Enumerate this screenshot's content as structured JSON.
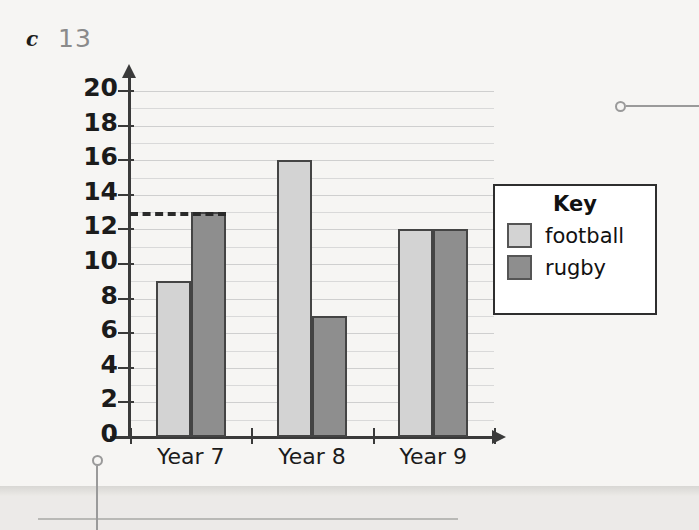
{
  "question": {
    "part_label": "c",
    "answer": "13"
  },
  "chart_data": {
    "type": "bar",
    "title": "",
    "xlabel": "",
    "ylabel": "",
    "categories": [
      "Year 7",
      "Year 8",
      "Year 9"
    ],
    "series": [
      {
        "name": "football",
        "color": "#d3d3d3",
        "values": [
          9,
          16,
          12
        ]
      },
      {
        "name": "rugby",
        "color": "#8e8e8e",
        "values": [
          13,
          7,
          12
        ]
      }
    ],
    "ylim": [
      0,
      20
    ],
    "ytick_step": 2,
    "ytick_labels": [
      "0",
      "2",
      "4",
      "6",
      "8",
      "10",
      "12",
      "14",
      "16",
      "18",
      "20"
    ],
    "gridline_step": 1,
    "grid": true,
    "legend_position": "right",
    "legend_title": "Key",
    "annotations": [
      {
        "type": "dashed-line",
        "orientation": "horizontal",
        "value": 13,
        "label": "13"
      }
    ]
  },
  "legend": {
    "title": "Key",
    "entries": [
      {
        "label": "football",
        "color": "#d3d3d3"
      },
      {
        "label": "rugby",
        "color": "#8e8e8e"
      }
    ]
  },
  "callouts": [
    {
      "name": "bottom-left-callout",
      "x": 97,
      "y": 460
    },
    {
      "name": "right-callout",
      "x": 620,
      "y": 106
    }
  ],
  "colors": {
    "football": "#d3d3d3",
    "rugby": "#8e8e8e",
    "axis": "#3a3a3a",
    "grid": "#d9d9d9",
    "answer_text": "#8a8a8a",
    "paper": "#f6f5f3"
  }
}
